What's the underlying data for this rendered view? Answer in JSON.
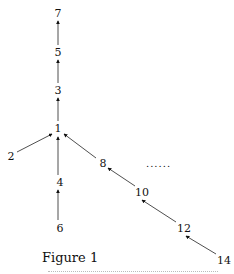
{
  "figure": {
    "caption": "Figure 1",
    "ellipsis": "......",
    "nodes": [
      {
        "id": "7",
        "label": "7",
        "x": 58,
        "y": 13
      },
      {
        "id": "5",
        "label": "5",
        "x": 58,
        "y": 52
      },
      {
        "id": "3",
        "label": "3",
        "x": 58,
        "y": 90
      },
      {
        "id": "1",
        "label": "1",
        "x": 58,
        "y": 128
      },
      {
        "id": "2",
        "label": "2",
        "x": 11,
        "y": 156
      },
      {
        "id": "4",
        "label": "4",
        "x": 60,
        "y": 182
      },
      {
        "id": "6",
        "label": "6",
        "x": 60,
        "y": 228
      },
      {
        "id": "8",
        "label": "8",
        "x": 103,
        "y": 163
      },
      {
        "id": "10",
        "label": "10",
        "x": 142,
        "y": 192
      },
      {
        "id": "12",
        "label": "12",
        "x": 184,
        "y": 228
      },
      {
        "id": "14",
        "label": "14",
        "x": 224,
        "y": 260
      }
    ],
    "edges": [
      {
        "from": "5",
        "to": "7"
      },
      {
        "from": "3",
        "to": "5"
      },
      {
        "from": "1",
        "to": "3"
      },
      {
        "from": "2",
        "to": "1"
      },
      {
        "from": "4",
        "to": "1"
      },
      {
        "from": "6",
        "to": "4"
      },
      {
        "from": "8",
        "to": "1"
      },
      {
        "from": "10",
        "to": "8"
      },
      {
        "from": "12",
        "to": "10"
      },
      {
        "from": "14",
        "to": "12"
      }
    ]
  }
}
